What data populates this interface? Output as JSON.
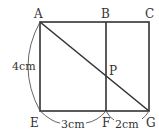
{
  "diagram": {
    "points": {
      "A": {
        "label": "A"
      },
      "B": {
        "label": "B"
      },
      "C": {
        "label": "C"
      },
      "E": {
        "label": "E"
      },
      "F": {
        "label": "F"
      },
      "G": {
        "label": "G"
      },
      "P": {
        "label": "P"
      }
    },
    "dimensions": {
      "AE": "4cm",
      "EF": "3cm",
      "FG": "2cm"
    },
    "colors": {
      "line": "#333333",
      "background": "#ffffff"
    }
  }
}
